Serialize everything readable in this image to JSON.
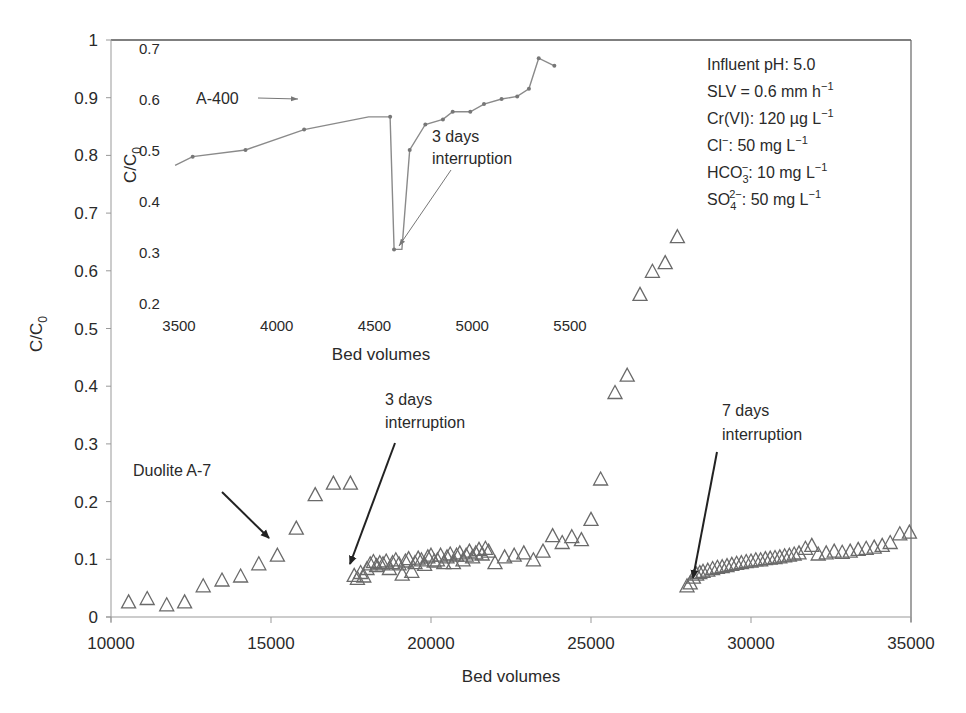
{
  "chart_data": [
    {
      "id": "main",
      "type": "scatter",
      "title": "",
      "xlabel": "Bed volumes",
      "ylabel": "C/C0",
      "xlim": [
        10000,
        35000
      ],
      "ylim": [
        0,
        1
      ],
      "x_ticks": [
        10000,
        15000,
        20000,
        25000,
        30000,
        35000
      ],
      "y_ticks": [
        0,
        0.1,
        0.2,
        0.3,
        0.4,
        0.5,
        0.6,
        0.7,
        0.8,
        0.9,
        1
      ],
      "y_tick_labels": [
        "0",
        "0.1",
        "0.2",
        "0.3",
        "0.4",
        "0.5",
        "0.6",
        "0.7",
        "0.8",
        "0.9",
        "1"
      ],
      "grid": false,
      "marker": "open-triangle",
      "series": [
        {
          "name": "Duolite A-7",
          "x": [
            10550,
            11130,
            11740,
            12300,
            12880,
            13470,
            14050,
            14620,
            15200,
            15790,
            16380,
            16950,
            17480,
            17600,
            17700,
            17800,
            17900,
            18000,
            18100,
            18200,
            18300,
            18400,
            18500,
            18600,
            18700,
            18800,
            18900,
            19000,
            19100,
            19200,
            19300,
            19400,
            19500,
            19600,
            19700,
            19800,
            19900,
            20000,
            20100,
            20200,
            20300,
            20400,
            20500,
            20600,
            20700,
            20800,
            20900,
            21000,
            21100,
            21200,
            21300,
            21400,
            21500,
            21600,
            21700,
            21800,
            22000,
            22300,
            22600,
            22900,
            23200,
            23500,
            23800,
            24100,
            24400,
            24700,
            25000,
            25300,
            25750,
            26130,
            26530,
            26920,
            27320,
            27700,
            28000,
            28100,
            28200,
            28300,
            28400,
            28500,
            28650,
            28800,
            28950,
            29100,
            29250,
            29400,
            29550,
            29700,
            29850,
            30000,
            30150,
            30300,
            30450,
            30600,
            30750,
            30900,
            31050,
            31200,
            31350,
            31500,
            31700,
            31900,
            32100,
            32350,
            32600,
            32850,
            33100,
            33350,
            33600,
            33850,
            34100,
            34350,
            34650,
            34950
          ],
          "y": [
            0.027,
            0.033,
            0.022,
            0.027,
            0.055,
            0.065,
            0.072,
            0.093,
            0.108,
            0.155,
            0.213,
            0.233,
            0.233,
            0.073,
            0.068,
            0.078,
            0.072,
            0.085,
            0.093,
            0.097,
            0.09,
            0.095,
            0.093,
            0.098,
            0.085,
            0.095,
            0.1,
            0.093,
            0.075,
            0.098,
            0.102,
            0.08,
            0.095,
            0.103,
            0.1,
            0.092,
            0.105,
            0.108,
            0.098,
            0.1,
            0.108,
            0.095,
            0.105,
            0.11,
            0.095,
            0.108,
            0.112,
            0.1,
            0.108,
            0.115,
            0.105,
            0.112,
            0.118,
            0.11,
            0.12,
            0.115,
            0.095,
            0.105,
            0.108,
            0.112,
            0.1,
            0.115,
            0.142,
            0.13,
            0.14,
            0.135,
            0.17,
            0.24,
            0.39,
            0.42,
            0.56,
            0.6,
            0.615,
            0.66,
            0.055,
            0.06,
            0.07,
            0.075,
            0.078,
            0.08,
            0.082,
            0.085,
            0.087,
            0.088,
            0.09,
            0.092,
            0.094,
            0.095,
            0.097,
            0.098,
            0.1,
            0.1,
            0.102,
            0.103,
            0.104,
            0.105,
            0.107,
            0.108,
            0.11,
            0.112,
            0.12,
            0.125,
            0.11,
            0.112,
            0.115,
            0.113,
            0.115,
            0.118,
            0.12,
            0.122,
            0.125,
            0.13,
            0.145,
            0.148
          ]
        }
      ],
      "annotations": [
        {
          "text": "Duolite A-7",
          "arrow_to": [
            15150,
            0.115
          ]
        },
        {
          "text_lines": [
            "3 days",
            "interruption"
          ],
          "arrow_to": [
            17550,
            0.085
          ]
        },
        {
          "text_lines": [
            "7 days",
            "interruption"
          ],
          "arrow_to": [
            27900,
            0.058
          ]
        }
      ]
    },
    {
      "id": "inset",
      "type": "line",
      "title": "",
      "xlabel": "Bed volumes",
      "ylabel": "C/C0",
      "xlim": [
        3300,
        5600
      ],
      "ylim": [
        0.2,
        0.7
      ],
      "x_ticks": [
        3500,
        4000,
        4500,
        5000,
        5500
      ],
      "y_ticks": [
        0.2,
        0.3,
        0.4,
        0.5,
        0.6,
        0.7
      ],
      "grid": false,
      "marker": "small-dot",
      "series": [
        {
          "name": "A-400",
          "x": [
            3480,
            3570,
            3840,
            4140,
            4580,
            4470,
            4600,
            4640,
            4680,
            4760,
            4850,
            4900,
            4990,
            5060,
            5150,
            5230,
            5290,
            5340,
            5420
          ],
          "y": [
            0.47,
            0.487,
            0.5,
            0.54,
            0.565,
            0.565,
            0.305,
            0.305,
            0.5,
            0.55,
            0.56,
            0.575,
            0.575,
            0.59,
            0.6,
            0.605,
            0.62,
            0.68,
            0.665
          ],
          "note": "Line dips sharply near 4600 bed volumes after 3-day interruption"
        }
      ],
      "annotations": [
        {
          "text": "A-400",
          "arrow_to": [
            4160,
            0.54
          ]
        },
        {
          "text_lines": [
            "3 days",
            "interruption"
          ],
          "arrow_to": [
            4620,
            0.31
          ]
        }
      ]
    }
  ],
  "main_axis": {
    "x_tick_labels": [
      "10000",
      "15000",
      "20000",
      "25000",
      "30000",
      "35000"
    ],
    "y_tick_labels": [
      "0",
      "0.1",
      "0.2",
      "0.3",
      "0.4",
      "0.5",
      "0.6",
      "0.7",
      "0.8",
      "0.9",
      "1"
    ],
    "xlabel": "Bed volumes",
    "ylabel_main": "C/C",
    "ylabel_sub": "0"
  },
  "inset_axis": {
    "x_tick_labels": [
      "3500",
      "4000",
      "4500",
      "5000",
      "5500"
    ],
    "y_tick_labels": [
      "0.2",
      "0.3",
      "0.4",
      "0.5",
      "0.6",
      "0.7"
    ],
    "xlabel": "Bed volumes",
    "ylabel_main": "C/C",
    "ylabel_sub": "0"
  },
  "annotations": {
    "duolite": "Duolite A-7",
    "a400": "A-400",
    "three_days_line1": "3 days",
    "three_days_line2": "interruption",
    "seven_days_line1": "7 days",
    "seven_days_line2": "interruption"
  },
  "conditions": {
    "influent_ph": "Influent pH: 5.0",
    "slv": {
      "base": "SLV = 0.6 mm h",
      "sup": "−1"
    },
    "crvi": {
      "base": "Cr(VI): 120 µg L",
      "sup": "−1"
    },
    "cl": {
      "ion": "Cl",
      "ion_sup": "−",
      "rest": ": 50 mg L",
      "sup": "−1"
    },
    "hco3": {
      "ion": "HCO",
      "ion_sub": "3",
      "ion_sup": "−",
      "rest": ": 10 mg L",
      "sup": "−1"
    },
    "so4": {
      "ion": "SO",
      "ion_sub": "4",
      "ion_sup": "2−",
      "rest": ": 50 mg L",
      "sup": "−1"
    }
  },
  "colors": {
    "axis": "#555555",
    "marker": "#6a6a6a",
    "inset_line": "#8a8a8a",
    "text": "#2a2a2a",
    "arrow": "#222222"
  }
}
